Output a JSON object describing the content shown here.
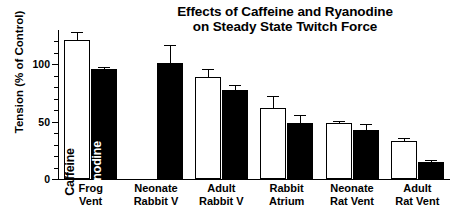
{
  "chart_data": {
    "type": "bar",
    "title": "Effects of Caffeine and Ryanodine on Steady State Twitch Force",
    "title_line1": "Effects of Caffeine and Ryanodine",
    "title_line2": "on Steady State Twitch Force",
    "xlabel": "",
    "ylabel": "Tension (% of Control)",
    "ylim": [
      0,
      130
    ],
    "yticks": [
      0,
      50,
      100
    ],
    "ytick_labels": [
      "0",
      "50",
      "100"
    ],
    "grid": false,
    "legend": "in-bar vertical labels on first group",
    "categories": [
      "Frog Vent",
      "Neonate Rabbit V",
      "Adult Rabbit V",
      "Rabbit Atrium",
      "Neonate Rat Vent",
      "Adult Rat Vent"
    ],
    "category_lines": [
      [
        "Frog",
        "Vent"
      ],
      [
        "Neonate",
        "Rabbit V"
      ],
      [
        "Adult",
        "Rabbit V"
      ],
      [
        "Rabbit",
        "Atrium"
      ],
      [
        "Neonate",
        "Rat Vent"
      ],
      [
        "Adult",
        "Rat Vent"
      ]
    ],
    "series": [
      {
        "name": "Caffeine",
        "style": "open",
        "values": [
          121,
          null,
          89,
          62,
          49,
          33
        ],
        "errors": [
          7,
          null,
          7,
          10,
          2,
          3
        ]
      },
      {
        "name": "Ryanodine",
        "style": "filled",
        "values": [
          96,
          101,
          78,
          49,
          43,
          15
        ],
        "errors": [
          2,
          16,
          4,
          7,
          5,
          2
        ]
      }
    ],
    "inbar_labels": [
      {
        "text": "Caffeine",
        "series": "Caffeine",
        "category": "Frog Vent",
        "color": "#000000"
      },
      {
        "text": "Ryanodine",
        "series": "Ryanodine",
        "category": "Frog Vent",
        "color": "#ffffff"
      }
    ],
    "colors": {
      "open_bar_fill": "#ffffff",
      "filled_bar_fill": "#000000",
      "axis": "#000000",
      "background": "#ffffff"
    }
  }
}
